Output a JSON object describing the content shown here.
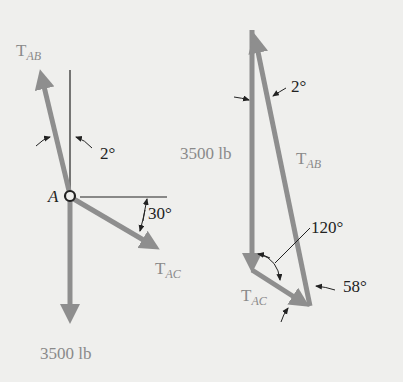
{
  "colors": {
    "background": "#efefed",
    "force_arrow": "#8e8e8e",
    "line": "#222222",
    "force_label": "#8a8a8a"
  },
  "free_body_diagram": {
    "point_label": "A",
    "forces": [
      {
        "name": "T",
        "subscript": "AB",
        "direction": "up, 2° left of vertical"
      },
      {
        "name": "T",
        "subscript": "AC",
        "direction": "down-right, 30° below horizontal"
      },
      {
        "name": "3500 lb",
        "subscript": "",
        "direction": "straight down"
      }
    ],
    "angles": {
      "tab_from_vertical": "2°",
      "tac_from_horizontal": "30°"
    },
    "weight_label": "3500 lb"
  },
  "force_triangle": {
    "weight_label": "3500 lb",
    "tab": {
      "name": "T",
      "subscript": "AB"
    },
    "tac": {
      "name": "T",
      "subscript": "AC"
    },
    "angles": {
      "top": "2°",
      "bottom_left": "120°",
      "bottom_right": "58°"
    }
  }
}
